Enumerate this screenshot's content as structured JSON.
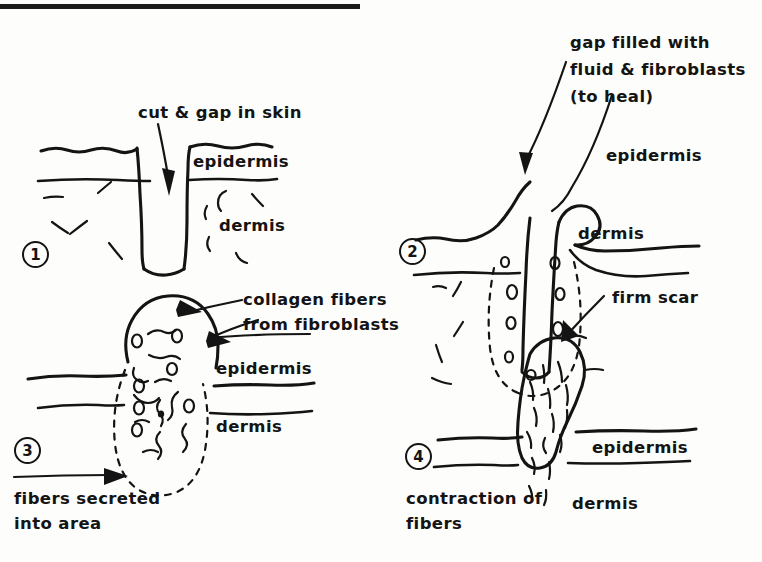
{
  "figure": {
    "title_rule": "top-horizontal-rule",
    "ink_color": "#141414",
    "background_color": "#fdfdfb"
  },
  "panels": [
    {
      "number": "1",
      "labels": {
        "callout": "cut & gap in skin",
        "epidermis": "epidermis",
        "dermis": "dermis"
      },
      "caption": ""
    },
    {
      "number": "2",
      "labels": {
        "callout_line1": "gap filled with",
        "callout_line2": "fluid & fibroblasts",
        "callout_line3": "(to heal)",
        "epidermis": "epidermis",
        "dermis": "dermis"
      },
      "caption": ""
    },
    {
      "number": "3",
      "labels": {
        "callout_line1": "collagen fibers",
        "callout_line2": "from fibroblasts",
        "epidermis": "epidermis",
        "dermis": "dermis"
      },
      "caption_line1": "fibers secreted",
      "caption_line2": "into area"
    },
    {
      "number": "4",
      "labels": {
        "callout": "firm scar",
        "epidermis": "epidermis",
        "dermis": "dermis"
      },
      "caption_line1": "contraction of",
      "caption_line2": "fibers"
    }
  ]
}
